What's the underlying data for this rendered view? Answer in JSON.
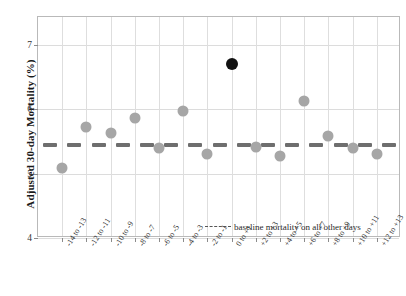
{
  "chart_data": {
    "type": "scatter",
    "title": "",
    "xlabel": "",
    "ylabel": "Adjusted 30-day Mortality (%)",
    "ylim": [
      4,
      7.43
    ],
    "yticks": [
      4,
      5,
      6,
      7
    ],
    "ytick_labels": [
      "4",
      "5",
      "6",
      "7"
    ],
    "grid": true,
    "legend_position": "inside-bottom-right",
    "categories": [
      "-14 to -13",
      "-12 to -11",
      "-10 to -9",
      "-8 to -7",
      "-6 to -5",
      "-4 to -3",
      "-2 to -1",
      "0 to +1",
      "+2 to +3",
      "+4 to +5",
      "+6 to +7",
      "+8 to +9",
      "+10 to +11",
      "+12 to +13"
    ],
    "series": [
      {
        "name": "Adjusted 30-day mortality",
        "marker": "circle",
        "color": "#a6a6a6",
        "highlight_color": "#111111",
        "values": [
          5.08,
          5.73,
          5.63,
          5.87,
          5.4,
          5.97,
          5.3,
          6.7,
          5.42,
          5.28,
          6.13,
          5.58,
          5.4,
          5.31
        ],
        "highlight_index": 7
      },
      {
        "name": "baseline mortality on all other days",
        "type": "dashed-line",
        "color": "#6e6e6e",
        "value": 5.45
      }
    ],
    "legend": [
      {
        "label": "baseline mortality on all other days",
        "style": "dashed",
        "color": "#6e6e6e"
      }
    ]
  },
  "colors": {
    "marker": "#a6a6a6",
    "marker_highlight": "#111111",
    "baseline": "#6e6e6e",
    "grid": "#dedede",
    "frame": "#b9b9b9",
    "text": "#1a1a1a"
  }
}
